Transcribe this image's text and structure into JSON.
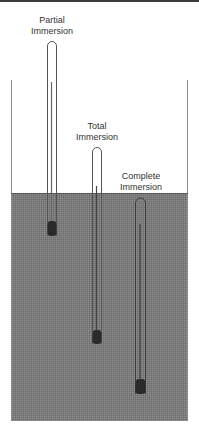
{
  "colors": {
    "liquid": "#7d7d7d",
    "wall": "#8a8a8a",
    "tube": "#3c3c3c",
    "bulb": "#2a2a2a",
    "text": "#333333"
  },
  "thermometers": [
    {
      "label_line1": "Partial",
      "label_line2": "Immersion"
    },
    {
      "label_line1": "Total",
      "label_line2": "Immersion"
    },
    {
      "label_line1": "Complete",
      "label_line2": "Immersion"
    }
  ]
}
